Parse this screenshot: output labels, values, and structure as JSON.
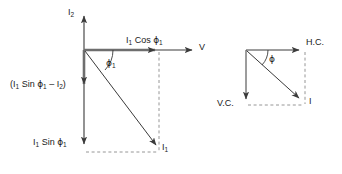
{
  "figure": {
    "stroke_color": "#3a3a3a",
    "dash_color": "#8a8a8a",
    "text_color": "#1a1a1a",
    "background": "#ffffff"
  },
  "left_diagram": {
    "name": "two-branch-current-phasor-diagram",
    "labels": {
      "vertical_axis_top": "I₂",
      "horizontal_axis_tip": "V",
      "horizontal_component": "I₁ Cos ϕ₁",
      "angle": "ϕ₁",
      "resultant_vector": "I₁",
      "vertical_difference": "(I₁ Sin ϕ₁ – I₂)",
      "vertical_component": "I₁ Sin ϕ₁"
    },
    "label_parts": {
      "vertical_axis_top_base": "I",
      "vertical_axis_top_sub": "2",
      "horizontal_component_pre": "I",
      "horizontal_component_sub1": "1",
      "horizontal_component_mid": " Cos ",
      "horizontal_component_phi": "ϕ",
      "horizontal_component_sub2": "1",
      "angle_phi": "ϕ",
      "angle_sub": "1",
      "resultant_base": "I",
      "resultant_sub": "1",
      "diff_open": "(I",
      "diff_sub1": "1",
      "diff_sin": " Sin ",
      "diff_phi": "ϕ",
      "diff_sub2": "1",
      "diff_minus": " – I",
      "diff_sub3": "2",
      "diff_close": ")",
      "vcomp_base": "I",
      "vcomp_sub1": "1",
      "vcomp_sin": " Sin ",
      "vcomp_phi": "ϕ",
      "vcomp_sub2": "1",
      "voltage": "V"
    },
    "geometry": {
      "origin_x": 84,
      "origin_y": 50,
      "v_axis_tip_y": 13,
      "h_axis_tip_x": 196,
      "cos_arrow_tip_x": 159,
      "i1_tip_x": 159,
      "i1_tip_y": 148,
      "down_arrow_tip_y": 148,
      "diff_arrow_tip_y": 88,
      "dashed_bottom_y": 152,
      "angle_deg": 44
    }
  },
  "right_diagram": {
    "name": "horizontal-vertical-component-phasor-diagram",
    "labels": {
      "horizontal_tip": "H.C.",
      "vertical_tip": "V.C.",
      "angle": "ϕ",
      "resultant_vector": "I"
    },
    "geometry": {
      "origin_x": 246,
      "origin_y": 50,
      "h_tip_x": 303,
      "v_tip_y": 103,
      "i_tip_x": 302,
      "i_tip_y": 101,
      "dashed_right_x": 305,
      "dashed_bottom_y": 105,
      "angle_deg": 43
    }
  }
}
